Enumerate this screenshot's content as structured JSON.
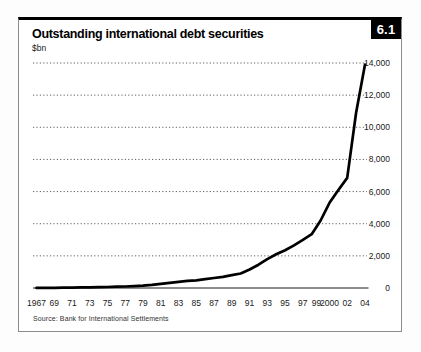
{
  "figure": {
    "number": "6.1",
    "title": "Outstanding international debt securities",
    "unit": "$bn",
    "source": "Source: Bank for International Settlements"
  },
  "chart_data": {
    "type": "line",
    "title": "Outstanding international debt securities",
    "ylabel": "$bn",
    "xlabel": "",
    "ylim": [
      0,
      14000
    ],
    "xlim": [
      1967,
      2004
    ],
    "grid": "horizontal dotted lines, zero axis solid",
    "legend": "none",
    "line_color": "#000000",
    "y_ticks": [
      0,
      2000,
      4000,
      6000,
      8000,
      10000,
      12000,
      14000
    ],
    "y_tick_labels": [
      "0",
      "2,000",
      "4,000",
      "6,000",
      "8,000",
      "10,000",
      "12,000",
      "14,000"
    ],
    "x_ticks": [
      {
        "label": "1967",
        "year": 1967
      },
      {
        "label": "69",
        "year": 1969
      },
      {
        "label": "71",
        "year": 1971
      },
      {
        "label": "73",
        "year": 1973
      },
      {
        "label": "75",
        "year": 1975
      },
      {
        "label": "77",
        "year": 1977
      },
      {
        "label": "79",
        "year": 1979
      },
      {
        "label": "81",
        "year": 1981
      },
      {
        "label": "83",
        "year": 1983
      },
      {
        "label": "85",
        "year": 1985
      },
      {
        "label": "87",
        "year": 1987
      },
      {
        "label": "89",
        "year": 1989
      },
      {
        "label": "91",
        "year": 1991
      },
      {
        "label": "93",
        "year": 1993
      },
      {
        "label": "95",
        "year": 1995
      },
      {
        "label": "97",
        "year": 1997
      },
      {
        "label": "99",
        "year": 1999
      },
      {
        "label": "2000",
        "year": 2000
      },
      {
        "label": "02",
        "year": 2002
      },
      {
        "label": "04",
        "year": 2004
      }
    ],
    "series": [
      {
        "name": "Outstanding international debt securities ($bn)",
        "x": [
          1967,
          1968,
          1969,
          1970,
          1971,
          1972,
          1973,
          1974,
          1975,
          1976,
          1977,
          1978,
          1979,
          1980,
          1981,
          1982,
          1983,
          1984,
          1985,
          1986,
          1987,
          1988,
          1989,
          1990,
          1991,
          1992,
          1993,
          1994,
          1995,
          1996,
          1997,
          1998,
          1999,
          2000,
          2001,
          2002,
          2003,
          2004
        ],
        "values": [
          5,
          10,
          15,
          20,
          28,
          35,
          45,
          55,
          65,
          80,
          95,
          120,
          150,
          200,
          260,
          320,
          380,
          440,
          480,
          550,
          620,
          700,
          800,
          900,
          1150,
          1450,
          1800,
          2100,
          2350,
          2650,
          3000,
          3350,
          4200,
          5300,
          6100,
          6850,
          10900,
          13900
        ]
      }
    ]
  }
}
